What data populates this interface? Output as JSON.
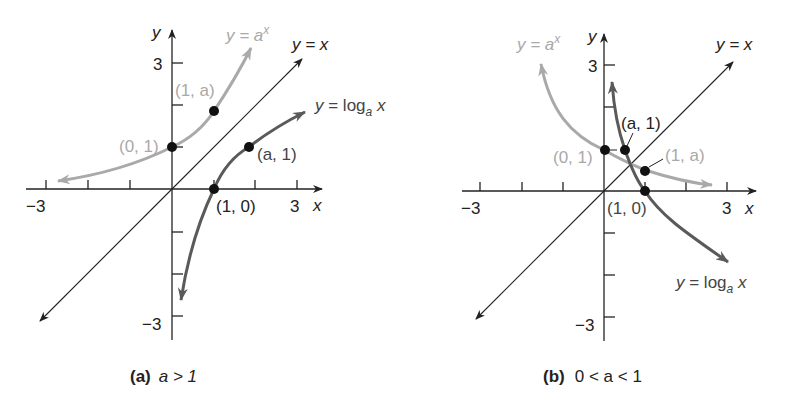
{
  "colors": {
    "axis": "#222222",
    "exp_curve": "#a9a9a9",
    "log_curve": "#5a5a5a",
    "identity_line": "#222222",
    "point": "#111111",
    "exp_label": "#a9a9a9",
    "log_label": "#444444"
  },
  "panels": [
    {
      "id": "a",
      "caption_tag": "(a)",
      "caption_condition": "a > 1",
      "axis_labels": {
        "x": "x",
        "y": "y"
      },
      "ticks": {
        "x_min": "−3",
        "x_max": "3",
        "y_max": "3",
        "y_min": "−3"
      },
      "curve_labels": {
        "exp": "y = a",
        "exp_sup": "x",
        "log": "y = log",
        "log_sub": "a",
        "log_var": " x",
        "identity": "y = x"
      },
      "points": [
        {
          "label": "(0, 1)",
          "x": 0,
          "y": 1,
          "curve": "exp"
        },
        {
          "label": "(1, a)",
          "x": 1,
          "y": 2.1,
          "curve": "exp"
        },
        {
          "label": "(a, 1)",
          "x": 2.1,
          "y": 1,
          "curve": "log"
        },
        {
          "label": "(1, 0)",
          "x": 1,
          "y": 0,
          "curve": "log"
        }
      ]
    },
    {
      "id": "b",
      "caption_tag": "(b)",
      "caption_condition": "0 < a < 1",
      "axis_labels": {
        "x": "x",
        "y": "y"
      },
      "ticks": {
        "x_min": "−3",
        "x_max": "3",
        "y_max": "3",
        "y_min": "−3"
      },
      "curve_labels": {
        "exp": "y = a",
        "exp_sup": "x",
        "log": "y = log",
        "log_sub": "a",
        "log_var": " x",
        "identity": "y = x"
      },
      "points": [
        {
          "label": "(0, 1)",
          "x": 0,
          "y": 1,
          "curve": "exp"
        },
        {
          "label": "(a, 1)",
          "x": 0.5,
          "y": 1,
          "curve": "log"
        },
        {
          "label": "(1, a)",
          "x": 1,
          "y": 0.5,
          "curve": "exp"
        },
        {
          "label": "(1, 0)",
          "x": 1,
          "y": 0,
          "curve": "log"
        }
      ]
    }
  ]
}
